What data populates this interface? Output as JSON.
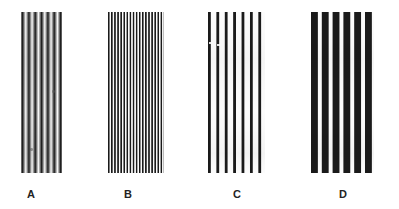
{
  "figure": {
    "background_color": "#ffffff",
    "bar_color": "#181818",
    "gap_color": "#ffffff",
    "label_color": "#232323",
    "width": 399,
    "height": 209
  },
  "panels": [
    {
      "id": "panel-a",
      "label": "A",
      "bar_count": 34,
      "period_px": 1.2,
      "bar_width_px": 0.6,
      "duty_cycle": 0.5,
      "x": 21,
      "y": 12,
      "width": 41,
      "height": 161,
      "label_x": 31,
      "label_y": 188,
      "appearance": "finest stripes, reads as mid-grey texture"
    },
    {
      "id": "panel-b",
      "label": "B",
      "bar_count": 18,
      "period_px": 3.1,
      "bar_width_px": 1.6,
      "duty_cycle": 0.5,
      "x": 108,
      "y": 12,
      "width": 56,
      "height": 161,
      "label_x": 128,
      "label_y": 188,
      "appearance": "fine stripes, clearly resolved"
    },
    {
      "id": "panel-c",
      "label": "C",
      "bar_count": 7,
      "period_px": 8.4,
      "bar_width_px": 2.6,
      "duty_cycle": 0.31,
      "x": 208,
      "y": 12,
      "width": 57,
      "height": 161,
      "label_x": 237,
      "label_y": 188,
      "appearance": "narrow black bars on wide white gaps"
    },
    {
      "id": "panel-d",
      "label": "D",
      "bar_count": 6,
      "period_px": 10.8,
      "bar_width_px": 6.4,
      "duty_cycle": 0.59,
      "x": 311,
      "y": 12,
      "width": 63,
      "height": 161,
      "label_x": 343,
      "label_y": 188,
      "appearance": "coarsest, thick black bars"
    }
  ]
}
